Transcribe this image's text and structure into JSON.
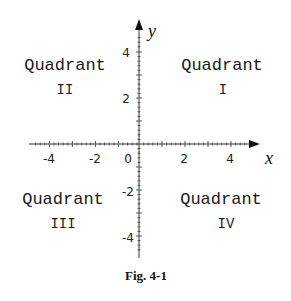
{
  "figure": {
    "caption": "Fig. 4-1",
    "x_axis_label": "x",
    "y_axis_label": "y",
    "x_ticks": [
      "-4",
      "-2",
      "0",
      "2",
      "4"
    ],
    "y_ticks": [
      "4",
      "2",
      "-2",
      "-4"
    ],
    "quadrants": [
      {
        "id": "I",
        "word": "Quadrant",
        "numeral": "I"
      },
      {
        "id": "II",
        "word": "Quadrant",
        "numeral": "II"
      },
      {
        "id": "III",
        "word": "Quadrant",
        "numeral": "III"
      },
      {
        "id": "IV",
        "word": "Quadrant",
        "numeral": "IV"
      }
    ],
    "colors": {
      "axis": "#333333",
      "text": "#1a1a1a",
      "background": "#ffffff"
    }
  }
}
